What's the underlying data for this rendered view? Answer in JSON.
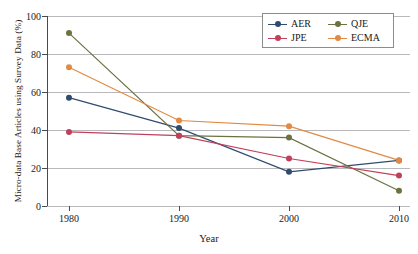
{
  "chart_data": {
    "type": "line",
    "title": "",
    "xlabel": "Year",
    "ylabel": "Micro-data Base Articles using Survey Data (%)",
    "x": [
      1980,
      1990,
      2000,
      2010
    ],
    "categories": [
      "1980",
      "1990",
      "2000",
      "2010"
    ],
    "xlim": [
      1978,
      2011
    ],
    "ylim": [
      0,
      100
    ],
    "yticks": [
      0,
      20,
      40,
      60,
      80,
      100
    ],
    "ytick_labels": [
      "0",
      "20",
      "40",
      "60",
      "80",
      "100"
    ],
    "xticks": [
      1980,
      1990,
      2000,
      2010
    ],
    "xtick_labels": [
      "1980",
      "1990",
      "2000",
      "2010"
    ],
    "grid": "horizontal",
    "legend_position": "upper-right",
    "series": [
      {
        "name": "AER",
        "color": "#2f4b6e",
        "values": [
          57,
          41,
          18,
          24
        ]
      },
      {
        "name": "QJE",
        "color": "#6b7340",
        "values": [
          91,
          37,
          36,
          8
        ]
      },
      {
        "name": "JPE",
        "color": "#c0405c",
        "values": [
          39,
          37,
          25,
          16
        ]
      },
      {
        "name": "ECMA",
        "color": "#e08a43",
        "values": [
          73,
          45,
          42,
          24
        ]
      }
    ]
  },
  "legend": {
    "entries": [
      {
        "label": "AER"
      },
      {
        "label": "QJE"
      },
      {
        "label": "JPE"
      },
      {
        "label": "ECMA"
      }
    ]
  }
}
